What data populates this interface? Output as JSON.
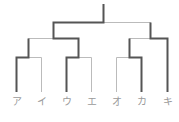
{
  "diagram": {
    "type": "tournament-bracket",
    "colors": {
      "win": "#555555",
      "lose": "#bbbbbb"
    },
    "participants": [
      {
        "label": "ア",
        "x": 16.5
      },
      {
        "label": "イ",
        "x": 41.5
      },
      {
        "label": "ウ",
        "x": 66.5
      },
      {
        "label": "エ",
        "x": 91.5
      },
      {
        "label": "オ",
        "x": 116.5
      },
      {
        "label": "カ",
        "x": 141.5
      },
      {
        "label": "キ",
        "x": 167.5
      }
    ],
    "matches": [
      {
        "round": 1,
        "players": [
          "ア",
          "イ"
        ],
        "winner": "ア"
      },
      {
        "round": 1,
        "players": [
          "ウ",
          "エ"
        ],
        "winner": "ウ"
      },
      {
        "round": 1,
        "players": [
          "オ",
          "カ"
        ],
        "winner": "カ"
      },
      {
        "round": 2,
        "players": [
          "ア",
          "ウ"
        ],
        "winner": "ウ"
      },
      {
        "round": 2,
        "players": [
          "カ",
          "キ"
        ],
        "winner": "キ"
      },
      {
        "round": 3,
        "players": [
          "ウ",
          "キ"
        ],
        "winner": "ウ"
      }
    ],
    "champion": "ウ"
  }
}
